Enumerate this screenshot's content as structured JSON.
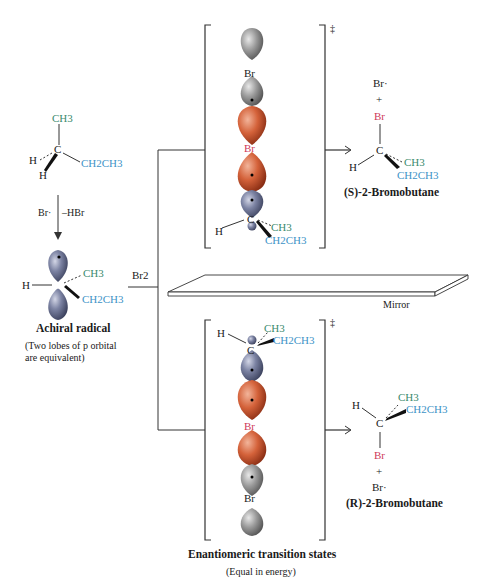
{
  "colors": {
    "green_group": "#3b8a6e",
    "blue_group": "#3e93c7",
    "bromine_red": "#cf3a5a",
    "p_orbital_blue": "#7c83a3",
    "br_orbital_gray": "#9a9a9a",
    "br_orbital_orange": "#d4623a"
  },
  "starting_material": {
    "ch3": "CH3",
    "c": "C",
    "h_left": "H",
    "h_bottom": "H",
    "ch2ch3": "CH2CH3"
  },
  "reaction_step": {
    "reagent": "Br·",
    "byproduct": "–HBr"
  },
  "radical": {
    "h": "H",
    "c": "C",
    "ch3": "CH3",
    "ch2ch3": "CH2CH3",
    "label": "Achiral radical",
    "note_line1": "(Two lobes of p orbital",
    "note_line2": "are equivalent)"
  },
  "br2_label": "Br2",
  "top_ts": {
    "dagger": "‡",
    "br_top": "Br",
    "br_mid": "Br",
    "c": "C",
    "h": "H",
    "ch3": "CH3",
    "ch2ch3": "CH2CH3"
  },
  "bottom_ts": {
    "dagger": "‡",
    "h": "H",
    "c": "C",
    "ch3": "CH3",
    "ch2ch3": "CH2CH3",
    "br_mid": "Br",
    "br_bottom": "Br"
  },
  "product_s": {
    "br_radical": "Br·",
    "plus": "+",
    "br": "Br",
    "c": "C",
    "h": "H",
    "ch3": "CH3",
    "ch2ch3": "CH2CH3",
    "name": "(S)-2-Bromobutane"
  },
  "product_r": {
    "h": "H",
    "ch3": "CH3",
    "ch2ch3": "CH2CH3",
    "c": "C",
    "br": "Br",
    "plus": "+",
    "br_radical": "Br·",
    "name": "(R)-2-Bromobutane"
  },
  "mirror_label": "Mirror",
  "footer": {
    "title": "Enantiomeric transition states",
    "subtitle": "(Equal in energy)"
  }
}
